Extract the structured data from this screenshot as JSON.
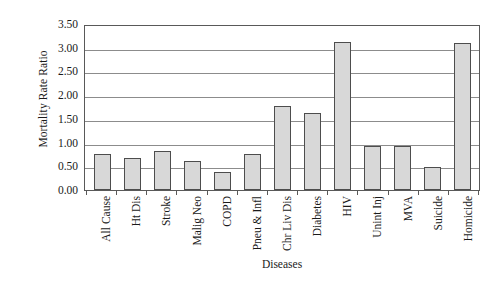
{
  "chart_data": {
    "type": "bar",
    "title": "",
    "xlabel": "Diseases",
    "ylabel": "Mortality Rate Ratio",
    "categories": [
      "All Cause",
      "Ht Dis",
      "Stroke",
      "Malig Neo",
      "COPD",
      "Pneu & Infl",
      "Chr Liv Dis",
      "Diabetes",
      "HIV",
      "Unint Inj",
      "MVA",
      "Suicide",
      "Homicide"
    ],
    "values": [
      0.75,
      0.67,
      0.82,
      0.62,
      0.38,
      0.76,
      1.78,
      1.62,
      3.12,
      0.93,
      0.92,
      0.48,
      3.1
    ],
    "ylim": [
      0.0,
      3.5
    ],
    "ytick_labels": [
      "0.00",
      "0.50",
      "1.00",
      "1.50",
      "2.00",
      "2.50",
      "3.00",
      "3.50"
    ],
    "ytick_values": [
      0.0,
      0.5,
      1.0,
      1.5,
      2.0,
      2.5,
      3.0,
      3.5
    ],
    "grid": "horizontal",
    "legend": "none",
    "bar_fill_color": "#d8d8d8",
    "bar_border_color": "#4d4d4d",
    "gridline_color": "#8c8c8c",
    "axis_color": "#595959"
  }
}
